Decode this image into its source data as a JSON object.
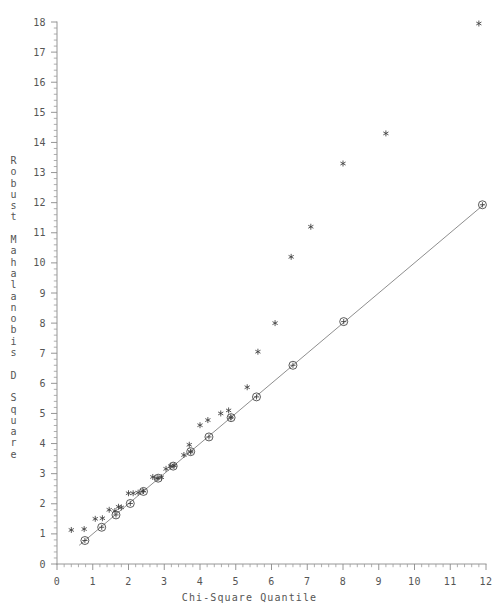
{
  "chart_data": {
    "type": "scatter",
    "title": "",
    "xlabel": "Chi-Square Quantile",
    "ylabel": "Robust Mahalanobis D Square",
    "xlim": [
      0,
      12
    ],
    "ylim": [
      0,
      18
    ],
    "xticks": [
      0,
      1,
      2,
      3,
      4,
      5,
      6,
      7,
      8,
      9,
      10,
      11,
      12
    ],
    "yticks": [
      0,
      1,
      2,
      3,
      4,
      5,
      6,
      7,
      8,
      9,
      10,
      11,
      12,
      13,
      14,
      15,
      16,
      17,
      18
    ],
    "xtick_labels": [
      "0",
      "1",
      "2",
      "3",
      "4",
      "5",
      "6",
      "7",
      "8",
      "9",
      "10",
      "11",
      "12"
    ],
    "ytick_labels": [
      "0",
      "1",
      "2",
      "3",
      "4",
      "5",
      "6",
      "7",
      "8",
      "9",
      "10",
      "11",
      "12",
      "13",
      "14",
      "15",
      "16",
      "17",
      "18"
    ],
    "x_minor_ticks_per_major": 5,
    "y_minor_ticks_per_major": 5,
    "grid": false,
    "legend": "none",
    "series": [
      {
        "name": "Robust Mahalanobis D Square (observed)",
        "marker": "asterisk",
        "points": [
          [
            0.4,
            1.13
          ],
          [
            0.76,
            1.16
          ],
          [
            1.07,
            1.5
          ],
          [
            1.27,
            1.52
          ],
          [
            1.46,
            1.8
          ],
          [
            1.62,
            1.76
          ],
          [
            1.72,
            1.9
          ],
          [
            1.8,
            1.88
          ],
          [
            2.0,
            2.35
          ],
          [
            2.13,
            2.35
          ],
          [
            2.27,
            2.37
          ],
          [
            2.4,
            2.43
          ],
          [
            2.68,
            2.89
          ],
          [
            2.8,
            2.85
          ],
          [
            2.92,
            2.88
          ],
          [
            3.05,
            3.16
          ],
          [
            3.18,
            3.25
          ],
          [
            3.28,
            3.27
          ],
          [
            3.55,
            3.62
          ],
          [
            3.7,
            3.96
          ],
          [
            3.74,
            3.73
          ],
          [
            4.0,
            4.61
          ],
          [
            4.22,
            4.78
          ],
          [
            4.58,
            5.0
          ],
          [
            4.8,
            5.1
          ],
          [
            4.86,
            4.87
          ],
          [
            5.32,
            5.87
          ],
          [
            5.62,
            7.05
          ],
          [
            6.1,
            8.0
          ],
          [
            6.55,
            10.2
          ],
          [
            7.1,
            11.2
          ],
          [
            8.0,
            13.3
          ],
          [
            9.2,
            14.3
          ],
          [
            11.8,
            17.95
          ]
        ]
      },
      {
        "name": "Chi-square reference quantiles",
        "marker": "circle-plus",
        "points": [
          [
            0.78,
            0.78
          ],
          [
            1.25,
            1.22
          ],
          [
            1.65,
            1.63
          ],
          [
            2.05,
            2.01
          ],
          [
            2.42,
            2.41
          ],
          [
            2.83,
            2.85
          ],
          [
            3.25,
            3.25
          ],
          [
            3.74,
            3.73
          ],
          [
            4.25,
            4.22
          ],
          [
            4.87,
            4.86
          ],
          [
            5.58,
            5.55
          ],
          [
            6.6,
            6.6
          ],
          [
            8.02,
            8.05
          ],
          [
            11.9,
            11.93
          ]
        ]
      }
    ],
    "reference_line": {
      "name": "45-degree reference line",
      "from": [
        0.62,
        0.62
      ],
      "to": [
        11.95,
        11.95
      ]
    }
  },
  "axes": {
    "x_title": "Chi-Square Quantile",
    "y_title_chars": [
      "R",
      "o",
      "b",
      "u",
      "s",
      "t",
      "",
      "M",
      "a",
      "h",
      "a",
      "l",
      "a",
      "n",
      "o",
      "b",
      "i",
      "s",
      "",
      "D",
      "",
      "S",
      "q",
      "u",
      "a",
      "r",
      "e"
    ]
  },
  "colors": {
    "background": "#ffffff",
    "axis": "#8a8a8a",
    "marker": "#3d3d3d",
    "reference_line": "#7a7a7a",
    "text": "#555555"
  }
}
